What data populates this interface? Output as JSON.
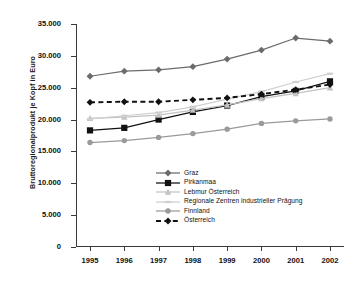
{
  "chart_data": {
    "type": "line",
    "title": "",
    "xlabel": "",
    "ylabel": "Bruttoregionalprodukt je Kopf in Euro",
    "categories": [
      "1995",
      "1996",
      "1997",
      "1998",
      "1999",
      "2000",
      "2001",
      "2002"
    ],
    "x": [
      1995,
      1996,
      1997,
      1998,
      1999,
      2000,
      2001,
      2002
    ],
    "ylim": [
      0,
      35000
    ],
    "yticks": [
      0,
      5000,
      10000,
      15000,
      20000,
      25000,
      30000,
      35000
    ],
    "ytick_labels": [
      "0",
      "5.000",
      "10.000",
      "15.000",
      "20.000",
      "25.000",
      "30.000",
      "35.000"
    ],
    "grid": false,
    "legend_position": "inside-lower-center",
    "series": [
      {
        "name": "Graz",
        "color": "#6b6b6b",
        "marker": "diamond",
        "dash": "solid",
        "values": [
          26800,
          27600,
          27800,
          28300,
          29500,
          30900,
          32800,
          32300
        ]
      },
      {
        "name": "Pirkanmaa",
        "color": "#111111",
        "marker": "square",
        "dash": "solid",
        "values": [
          18300,
          18700,
          20000,
          21200,
          22200,
          23600,
          24500,
          26000
        ]
      },
      {
        "name": "Lebmur Österreich",
        "color": "#c2c2c2",
        "marker": "triangle",
        "dash": "solid",
        "values": [
          20200,
          20400,
          20700,
          21500,
          22300,
          23300,
          24100,
          25000
        ]
      },
      {
        "name": "Regionale Zentren industrieller Prägung",
        "color": "#cfcfcf",
        "marker": "line",
        "dash": "solid",
        "values": [
          20100,
          20600,
          21100,
          22000,
          23200,
          24400,
          25900,
          27200
        ]
      },
      {
        "name": "Finnland",
        "color": "#9a9a9a",
        "marker": "circle",
        "dash": "solid",
        "values": [
          16400,
          16700,
          17200,
          17800,
          18500,
          19400,
          19800,
          20100
        ]
      },
      {
        "name": "Österreich",
        "color": "#111111",
        "marker": "diamond",
        "dash": "dashed",
        "values": [
          22700,
          22800,
          22800,
          23100,
          23400,
          24000,
          24700,
          25500
        ]
      }
    ]
  },
  "axis": {
    "y_title": "Bruttoregionalprodukt je Kopf in Euro"
  },
  "legend": {
    "items": [
      {
        "label": "Graz"
      },
      {
        "label": "Pirkanmaa"
      },
      {
        "label": "Lebmur Österreich"
      },
      {
        "label": "Regionale Zentren industrieller Prägung"
      },
      {
        "label": "Finnland"
      },
      {
        "label": "Österreich"
      }
    ]
  }
}
